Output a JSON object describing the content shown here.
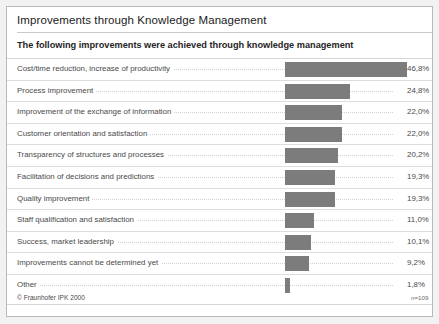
{
  "card": {
    "title": "Improvements through Knowledge Management",
    "subtitle": "The following improvements were achieved through knowledge management",
    "copyright": "© Fraunhofer IPK 2000",
    "sample_size": "n=109",
    "bar_color": "#7c7c7c",
    "text_color": "#4a4a4a",
    "border_color": "#b9b9b9"
  },
  "chart_data": {
    "type": "bar",
    "orientation": "horizontal",
    "title": "Improvements through Knowledge Management",
    "subtitle": "The following improvements were achieved through knowledge management",
    "xlabel": "",
    "ylabel": "",
    "xlim": [
      0,
      46.8
    ],
    "grid": false,
    "legend": null,
    "value_suffix": "%",
    "decimal_separator": ",",
    "annotations": [
      "n=109",
      "© Fraunhofer IPK 2000"
    ],
    "categories": [
      "Cost/time reduction, increase of productivity",
      "Process improvement",
      "Improvement of the exchange of information",
      "Customer orientation and satisfaction",
      "Transparency of structures and processes",
      "Facilitation of decisions and predictions",
      "Quality improvement",
      "Staff qualification and satisfaction",
      "Success, market leadership",
      "Improvements cannot be determined yet",
      "Other"
    ],
    "values": [
      46.8,
      24.8,
      22.0,
      22.0,
      20.2,
      19.3,
      19.3,
      11.0,
      10.1,
      9.2,
      1.8
    ],
    "value_labels": [
      "46,8%",
      "24,8%",
      "22,0%",
      "22,0%",
      "20,2%",
      "19,3%",
      "19,3%",
      "11,0%",
      "10,1%",
      "9,2%",
      "1,8%"
    ]
  }
}
